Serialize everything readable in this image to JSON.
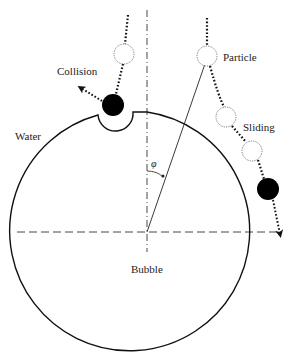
{
  "diagram": {
    "labels": {
      "collision": "Collision",
      "particle": "Particle",
      "sliding": "Sliding",
      "water": "Water",
      "bubble": "Bubble",
      "angle": "φ"
    },
    "colors": {
      "stroke": "#111111",
      "particle_fill": "#000000",
      "background": "#ffffff"
    },
    "bubble": {
      "cx": 147,
      "cy": 232,
      "r": 120
    },
    "particles": [
      {
        "role": "collision-approach",
        "cx": 124,
        "cy": 54,
        "r": 10,
        "style": "dotted-outline"
      },
      {
        "role": "collision-contact",
        "cx": 113,
        "cy": 105,
        "r": 11,
        "style": "filled"
      },
      {
        "role": "particle-start",
        "cx": 207,
        "cy": 56,
        "r": 10,
        "style": "dotted-outline"
      },
      {
        "role": "sliding-1",
        "cx": 226,
        "cy": 117,
        "r": 10,
        "style": "dotted-outline"
      },
      {
        "role": "sliding-2",
        "cx": 252,
        "cy": 151,
        "r": 10,
        "style": "dotted-outline"
      },
      {
        "role": "sliding-detach",
        "cx": 268,
        "cy": 189,
        "r": 11,
        "style": "filled"
      }
    ]
  }
}
